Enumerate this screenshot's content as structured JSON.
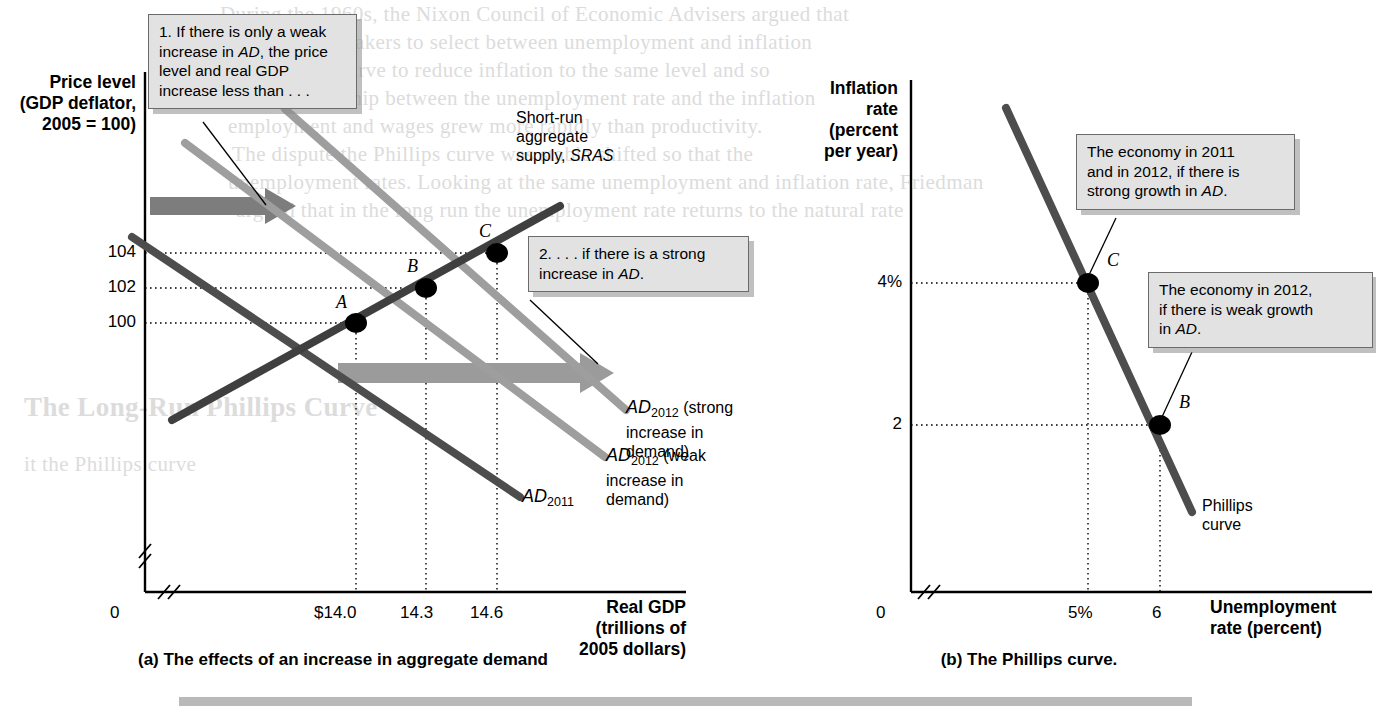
{
  "figure": {
    "panel_a": {
      "caption": "(a) The effects of an increase in aggregate demand",
      "y_axis_title_line1": "Price level",
      "y_axis_title_line2": "(GDP deflator,",
      "y_axis_title_line3": "2005 = 100)",
      "x_axis_title_line1": "Real GDP",
      "x_axis_title_line2": "(trillions of",
      "x_axis_title_line3": "2005 dollars)",
      "origin_label": "0",
      "y_ticks": [
        "104",
        "102",
        "100"
      ],
      "x_ticks": [
        "$14.0",
        "14.3",
        "14.6"
      ],
      "sras_label_line1": "Short-run",
      "sras_label_line2": "aggregate",
      "sras_label_line3": "supply, SRAS",
      "sras_label_italic": "SRAS",
      "ad2011_label": "AD",
      "ad2011_sub": "2011",
      "ad2012_weak_label": "AD",
      "ad2012_weak_sub": "2012",
      "ad2012_weak_rest_line1": " (weak",
      "ad2012_weak_rest_line2": "increase in",
      "ad2012_weak_rest_line3": "demand)",
      "ad2012_strong_label": "AD",
      "ad2012_strong_sub": "2012",
      "ad2012_strong_rest_line1": " (strong",
      "ad2012_strong_rest_line2": "increase in",
      "ad2012_strong_rest_line3": "demand)",
      "points": [
        {
          "name": "A",
          "x": 14.0,
          "y": 100
        },
        {
          "name": "B",
          "x": 14.3,
          "y": 102
        },
        {
          "name": "C",
          "x": 14.6,
          "y": 104
        }
      ],
      "callout1": "1. If there is only a weak increase in AD, the price level and real GDP increase less than . . .",
      "callout1_lines": [
        "1. If there is only a weak",
        "increase in AD, the price",
        "level and real GDP",
        "increase less than . . ."
      ],
      "callout2_lines": [
        "2. . . . if there is a strong",
        "increase in AD."
      ]
    },
    "panel_b": {
      "caption": "(b) The Phillips curve.",
      "y_axis_title_line1": "Inflation",
      "y_axis_title_line2": "rate",
      "y_axis_title_line3": "(percent",
      "y_axis_title_line4": "per year)",
      "x_axis_title_line1": "Unemployment",
      "x_axis_title_line2": "rate (percent)",
      "origin_label": "0",
      "y_ticks": [
        "4%",
        "2"
      ],
      "x_ticks": [
        "5%",
        "6"
      ],
      "curve_label_line1": "Phillips",
      "curve_label_line2": "curve",
      "points": [
        {
          "name": "C",
          "x": 5,
          "y": 4
        },
        {
          "name": "B",
          "x": 6,
          "y": 2
        }
      ],
      "callout1_lines": [
        "The economy in 2011",
        "and in 2012, if there is",
        "strong growth in AD."
      ],
      "callout2_lines": [
        "The economy in 2012,",
        "if there is weak growth",
        "in AD."
      ]
    }
  },
  "chart_data": [
    {
      "type": "line",
      "panel": "a",
      "title": "(a) The effects of an increase in aggregate demand",
      "xlabel": "Real GDP (trillions of 2005 dollars)",
      "ylabel": "Price level (GDP deflator, 2005 = 100)",
      "xlim": [
        13.6,
        15.2
      ],
      "ylim": [
        95,
        110
      ],
      "xticks": [
        "$14.0",
        "14.3",
        "14.6"
      ],
      "xtick_values": [
        14.0,
        14.3,
        14.6
      ],
      "yticks": [
        "104",
        "102",
        "100"
      ],
      "ytick_values": [
        104,
        102,
        100
      ],
      "grid": false,
      "legend": "inline-labels",
      "series": [
        {
          "name": "Short-run aggregate supply, SRAS",
          "slope": "upward",
          "color": "#4a4a4a",
          "points": [
            [
              13.75,
              97.0
            ],
            [
              14.9,
              106.0
            ]
          ]
        },
        {
          "name": "AD2011",
          "slope": "downward",
          "color": "#4a4a4a",
          "points": [
            [
              13.65,
              106.0
            ],
            [
              14.45,
              96.5
            ]
          ]
        },
        {
          "name": "AD2012 (weak increase in demand)",
          "slope": "downward",
          "color": "#9a9a9a",
          "points": [
            [
              13.95,
              107.5
            ],
            [
              14.85,
              97.0
            ]
          ]
        },
        {
          "name": "AD2012 (strong increase in demand)",
          "slope": "downward",
          "color": "#9a9a9a",
          "points": [
            [
              14.2,
              109.0
            ],
            [
              15.05,
              99.0
            ]
          ]
        }
      ],
      "annotated_points": [
        {
          "label": "A",
          "x": 14.0,
          "y": 100
        },
        {
          "label": "B",
          "x": 14.3,
          "y": 102
        },
        {
          "label": "C",
          "x": 14.6,
          "y": 104
        }
      ]
    },
    {
      "type": "line",
      "panel": "b",
      "title": "(b) The Phillips curve.",
      "xlabel": "Unemployment rate (percent)",
      "ylabel": "Inflation rate (percent per year)",
      "xlim": [
        3.4,
        7.4
      ],
      "ylim": [
        0.6,
        6.2
      ],
      "xticks": [
        "5%",
        "6"
      ],
      "xtick_values": [
        5,
        6
      ],
      "yticks": [
        "4%",
        "2"
      ],
      "ytick_values": [
        4,
        2
      ],
      "grid": false,
      "series": [
        {
          "name": "Phillips curve",
          "slope": "downward",
          "color": "#4a4a4a",
          "points": [
            [
              4.2,
              5.9
            ],
            [
              6.6,
              1.0
            ]
          ]
        }
      ],
      "annotated_points": [
        {
          "label": "C",
          "x": 5,
          "y": 4
        },
        {
          "label": "B",
          "x": 6,
          "y": 2
        }
      ]
    }
  ],
  "bleed_text": {
    "lines": [
      "During the 1960s, the Nixon Council of Economic Advisers argued that",
      "it the Phillips curve",
      "to the policymakers to select between unemployment and inflation",
      "the Phillips curve to reduce inflation to the same level and so",
      "some relationship between the unemployment rate and the inflation",
      "employment and wages grew more rapidly than productivity.",
      "The dispute the Phillips curve was stable shifted so that the",
      "unemployment rates. Looking at the same unemployment and inflation rate, Friedman",
      "argued that in the long run the unemployment rate returns to the natural rate",
      "The Long-Run Phillips Curve"
    ]
  }
}
